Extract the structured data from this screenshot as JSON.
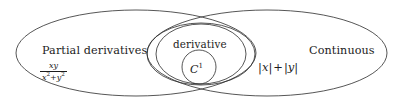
{
  "diagram": {
    "type": "euler-diagram",
    "background_color": "#ffffff",
    "stroke_color": "#2b2b2b",
    "stroke_width": 0.8,
    "regions": [
      {
        "name": "partial-derivatives",
        "label": "Partial derivatives",
        "example": "xy / (x^2 + y^2)",
        "shape": "ellipse"
      },
      {
        "name": "derivative",
        "label": "derivative",
        "shape": "ellipse"
      },
      {
        "name": "c1",
        "label": "C",
        "superscript": "1",
        "shape": "circle"
      },
      {
        "name": "continuous",
        "label": "Continuous",
        "example": "|x| + |y|",
        "shape": "ellipse"
      }
    ],
    "labels": {
      "partial_derivatives": "Partial derivatives",
      "derivative": "derivative",
      "continuous": "Continuous",
      "c1_base": "C",
      "c1_superscript": "1"
    },
    "formulas": {
      "partial_numerator": "xy",
      "partial_denominator_base1": "x",
      "partial_denominator_sup1": "2",
      "partial_denominator_plus": "+",
      "partial_denominator_base2": "y",
      "partial_denominator_sup2": "2",
      "continuous_abs_x": "x",
      "continuous_abs_y": "y",
      "continuous_plus": "+",
      "bar": "|"
    }
  }
}
